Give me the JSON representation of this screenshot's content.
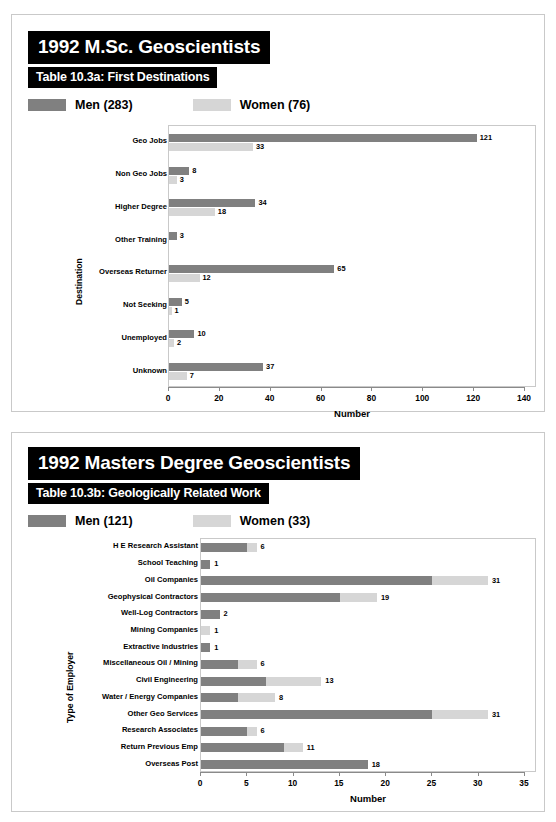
{
  "panel_a": {
    "main_title": "1992 M.Sc. Geoscientists",
    "sub_title": "Table 10.3a: First Destinations",
    "legend": {
      "men": "Men (283)",
      "women": "Women (76)"
    }
  },
  "panel_b": {
    "main_title": "1992 Masters Degree Geoscientists",
    "sub_title": "Table 10.3b: Geologically Related Work",
    "legend": {
      "men": "Men (121)",
      "women": "Women (33)"
    }
  },
  "chart_data": [
    {
      "type": "bar",
      "orientation": "horizontal",
      "grouping": "grouped",
      "title": "Table 10.3a: First Destinations",
      "xlabel": "Number",
      "ylabel": "Destination",
      "xlim": [
        0,
        140
      ],
      "xticks": [
        0,
        20,
        40,
        60,
        80,
        100,
        120,
        140
      ],
      "grid": false,
      "legend_position": "above-plot",
      "categories": [
        "Geo Jobs",
        "Non Geo Jobs",
        "Higher Degree",
        "Other Training",
        "Overseas Returner",
        "Not Seeking",
        "Unemployed",
        "Unknown"
      ],
      "series": [
        {
          "name": "Men (283)",
          "color": "#808080",
          "values": [
            121,
            8,
            34,
            3,
            65,
            5,
            10,
            37
          ]
        },
        {
          "name": "Women (76)",
          "color": "#d6d6d6",
          "values": [
            33,
            3,
            18,
            0,
            12,
            1,
            2,
            7
          ]
        }
      ]
    },
    {
      "type": "bar",
      "orientation": "horizontal",
      "grouping": "stacked",
      "title": "Table 10.3b: Geologically Related Work",
      "xlabel": "Number",
      "ylabel": "Type of Employer",
      "xlim": [
        0,
        35
      ],
      "xticks": [
        0,
        5,
        10,
        15,
        20,
        25,
        30,
        35
      ],
      "grid": false,
      "legend_position": "above-plot",
      "categories": [
        "H E Research Assistant",
        "School Teaching",
        "Oil Companies",
        "Geophysical Contractors",
        "Well-Log Contractors",
        "Mining Companies",
        "Extractive Industries",
        "Miscellaneous Oil / Mining",
        "Civil Engineering",
        "Water / Energy Companies",
        "Other Geo Services",
        "Research Associates",
        "Return Previous Emp",
        "Overseas Post"
      ],
      "series": [
        {
          "name": "Men (121)",
          "color": "#808080",
          "values": [
            5,
            1,
            25,
            15,
            2,
            0,
            1,
            4,
            7,
            4,
            25,
            5,
            9,
            18
          ]
        },
        {
          "name": "Women (33)",
          "color": "#d6d6d6",
          "values": [
            1,
            0,
            6,
            4,
            0,
            1,
            0,
            2,
            6,
            4,
            6,
            1,
            2,
            0
          ]
        }
      ],
      "totals": [
        6,
        1,
        31,
        19,
        2,
        1,
        1,
        6,
        13,
        8,
        31,
        6,
        11,
        18
      ]
    }
  ]
}
